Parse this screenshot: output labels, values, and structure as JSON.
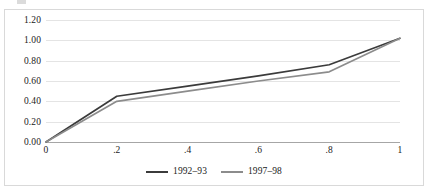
{
  "chart_data": {
    "type": "line",
    "title": "",
    "xlabel": "",
    "ylabel": "",
    "x": [
      0,
      0.2,
      0.4,
      0.6,
      0.8,
      1
    ],
    "xlim": [
      0,
      1
    ],
    "ylim": [
      0,
      1.2
    ],
    "grid": true,
    "legend_position": "bottom-center",
    "xtick_labels": [
      "0",
      ".2",
      ".4",
      ".6",
      ".8",
      "1"
    ],
    "ytick_labels": [
      "0.00",
      "0.20",
      "0.40",
      "0.60",
      "0.80",
      "1.00",
      "1.20"
    ],
    "ytick_values": [
      0,
      0.2,
      0.4,
      0.6,
      0.8,
      1.0,
      1.2
    ],
    "series": [
      {
        "name": "1992–93",
        "color": "#3b3b3b",
        "values": [
          0,
          0.45,
          0.55,
          0.65,
          0.76,
          1.02
        ]
      },
      {
        "name": "1997–98",
        "color": "#8c8c8c",
        "values": [
          0,
          0.4,
          0.5,
          0.6,
          0.69,
          1.02
        ]
      }
    ]
  },
  "style": {
    "grid_color": "#e4e4e4",
    "axis_color": "#a6a6a6",
    "border_color": "#d9d9d9",
    "background": "#ffffff",
    "text_color": "#1a1a1a"
  }
}
